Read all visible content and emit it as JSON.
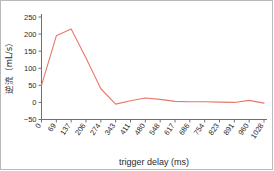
{
  "figure": {
    "border_color": "#b9b9b9",
    "background": "#ffffff"
  },
  "chart_data": {
    "type": "line",
    "title": "",
    "xlabel": "trigger delay (ms)",
    "ylabel": "逆流（mL/s）",
    "ylabel_plain": "逆流 (mL/s)",
    "line_color": "#e8776a",
    "grid": false,
    "legend": "none",
    "xlim": [
      0,
      1028
    ],
    "ylim": [
      -50,
      250
    ],
    "yticks": [
      -50,
      0,
      50,
      100,
      150,
      200,
      250
    ],
    "ytick_labels": [
      "−50",
      "0",
      "50",
      "100",
      "150",
      "200",
      "250"
    ],
    "categories": [
      0,
      69,
      137,
      206,
      274,
      343,
      411,
      480,
      548,
      617,
      686,
      754,
      823,
      891,
      960,
      1028
    ],
    "xtick_labels": [
      "0",
      "69",
      "137",
      "206",
      "274",
      "343",
      "411",
      "480",
      "548",
      "617",
      "686",
      "754",
      "823",
      "891",
      "960",
      "1028"
    ],
    "values": [
      50,
      195,
      215,
      130,
      40,
      -5,
      5,
      13,
      9,
      3,
      2,
      2,
      1,
      0,
      6,
      -2
    ]
  }
}
